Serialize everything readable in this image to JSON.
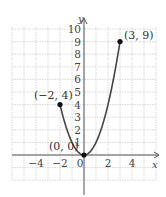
{
  "chart_data": {
    "type": "line",
    "title": "",
    "function": "y = x^2 on [-2, 3]",
    "xlabel": "x",
    "ylabel": "y",
    "xlim": [
      -6,
      6
    ],
    "ylim": [
      -2,
      10
    ],
    "grid": true,
    "x_tick_labels": [
      "−4",
      "−2",
      "0",
      "2",
      "4"
    ],
    "x_ticks": [
      -4,
      -2,
      0,
      2,
      4
    ],
    "y_tick_labels": [
      "1",
      "2",
      "3",
      "4",
      "5",
      "6",
      "7",
      "8",
      "9",
      "10"
    ],
    "y_ticks": [
      1,
      2,
      3,
      4,
      5,
      6,
      7,
      8,
      9,
      10
    ],
    "series": [
      {
        "name": "y = x^2",
        "x": [
          -2,
          -1.5,
          -1,
          -0.5,
          0,
          0.5,
          1,
          1.5,
          2,
          2.5,
          3
        ],
        "y": [
          4,
          2.25,
          1,
          0.25,
          0,
          0.25,
          1,
          2.25,
          4,
          6.25,
          9
        ]
      }
    ],
    "points": [
      {
        "x": -2,
        "y": 4,
        "label": "(−2, 4)"
      },
      {
        "x": 0,
        "y": 0,
        "label": "(0, 0)"
      },
      {
        "x": 3,
        "y": 9,
        "label": "(3, 9)"
      }
    ]
  }
}
